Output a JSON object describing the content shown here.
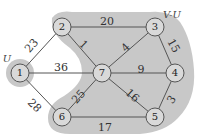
{
  "diagram": {
    "type": "weighted-graph",
    "set_labels": [
      {
        "id": "U",
        "text": "U",
        "x": 7,
        "y": 62
      },
      {
        "id": "V-U",
        "text": "V-U",
        "x": 172,
        "y": 18
      }
    ],
    "regions": {
      "U_fill": "#c8c8c8",
      "VU_fill": "#c8c8c8"
    },
    "nodes": [
      {
        "id": "1",
        "label": "1",
        "x": 20,
        "y": 73
      },
      {
        "id": "2",
        "label": "2",
        "x": 62,
        "y": 27
      },
      {
        "id": "3",
        "label": "3",
        "x": 155,
        "y": 27
      },
      {
        "id": "4",
        "label": "4",
        "x": 175,
        "y": 73
      },
      {
        "id": "5",
        "label": "5",
        "x": 155,
        "y": 117
      },
      {
        "id": "6",
        "label": "6",
        "x": 62,
        "y": 117
      },
      {
        "id": "7",
        "label": "7",
        "x": 102,
        "y": 73
      }
    ],
    "edges": [
      {
        "from": "1",
        "to": "2",
        "weight": "23",
        "lx": 32,
        "ly": 46,
        "rot": -48
      },
      {
        "from": "1",
        "to": "7",
        "weight": "36",
        "lx": 61,
        "ly": 68,
        "rot": 0
      },
      {
        "from": "1",
        "to": "6",
        "weight": "28",
        "lx": 34,
        "ly": 106,
        "rot": 45
      },
      {
        "from": "2",
        "to": "3",
        "weight": "20",
        "lx": 107,
        "ly": 22,
        "rot": 0
      },
      {
        "from": "2",
        "to": "7",
        "weight": "1",
        "lx": 83,
        "ly": 45,
        "rot": 45
      },
      {
        "from": "3",
        "to": "7",
        "weight": "4",
        "lx": 126,
        "ly": 48,
        "rot": -45
      },
      {
        "from": "3",
        "to": "4",
        "weight": "15",
        "lx": 173,
        "ly": 46,
        "rot": 60
      },
      {
        "from": "7",
        "to": "4",
        "weight": "9",
        "lx": 141,
        "ly": 70,
        "rot": 0
      },
      {
        "from": "7",
        "to": "5",
        "weight": "16",
        "lx": 132,
        "ly": 96,
        "rot": 42
      },
      {
        "from": "7",
        "to": "6",
        "weight": "25",
        "lx": 79,
        "ly": 97,
        "rot": -48
      },
      {
        "from": "4",
        "to": "5",
        "weight": "3",
        "lx": 172,
        "ly": 100,
        "rot": -55
      },
      {
        "from": "6",
        "to": "5",
        "weight": "17",
        "lx": 105,
        "ly": 128,
        "rot": 0
      }
    ],
    "colors": {
      "edge": "#555555",
      "node_fill": "#d9d9d9",
      "node_stroke": "#555555",
      "region": "#c8c8c8"
    }
  }
}
